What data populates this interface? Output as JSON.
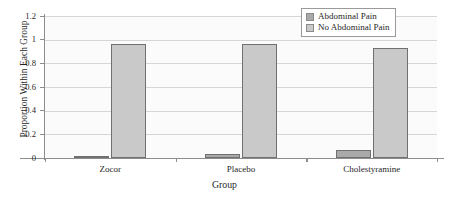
{
  "chart_data": {
    "type": "bar",
    "title": "",
    "xlabel": "Group",
    "ylabel": "Proportion Within Each Group",
    "categories": [
      "Zocor",
      "Placebo",
      "Cholestyramine"
    ],
    "series": [
      {
        "name": "Abdominal Pain",
        "color": "#a9a9a9",
        "values": [
          0.02,
          0.03,
          0.07
        ]
      },
      {
        "name": "No Abdominal Pain",
        "color": "#c9c9c9",
        "values": [
          0.96,
          0.965,
          0.93
        ]
      }
    ],
    "ylim": [
      0,
      1.2
    ],
    "yticks": [
      0,
      0.2,
      0.4,
      0.6,
      0.8,
      1,
      1.2
    ],
    "ytick_labels": [
      "0",
      "0.2",
      "0.4",
      "0.6",
      "0.8",
      "1",
      "1.2"
    ],
    "grid": "horizontal",
    "legend_position": "top-right"
  },
  "legend": {
    "items": [
      {
        "label": "Abdominal Pain",
        "swatch": "legend-swatch-abdominal-pain"
      },
      {
        "label": "No Abdominal Pain",
        "swatch": "legend-swatch-no-abdominal-pain"
      }
    ]
  }
}
